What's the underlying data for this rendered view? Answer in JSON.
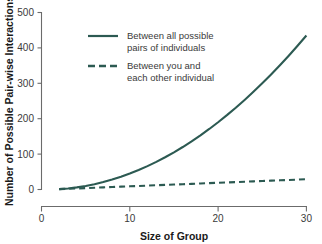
{
  "chart_data": {
    "type": "line",
    "title": "",
    "xlabel": "Size of Group",
    "ylabel": "Number of Possible Pair-wise Interactions",
    "xlim": [
      0,
      30
    ],
    "ylim": [
      0,
      500
    ],
    "xticks": [
      0,
      10,
      20,
      30
    ],
    "yticks": [
      0,
      100,
      200,
      300,
      400,
      500
    ],
    "xtick_labels": [
      "0",
      "10",
      "20",
      "30"
    ],
    "ytick_labels": [
      "0",
      "100",
      "200",
      "300",
      "400",
      "500"
    ],
    "grid": false,
    "legend_position": "upper-left-inside",
    "line_color": "#2c5a52",
    "x": [
      2,
      3,
      4,
      5,
      6,
      7,
      8,
      9,
      10,
      11,
      12,
      13,
      14,
      15,
      16,
      17,
      18,
      19,
      20,
      21,
      22,
      23,
      24,
      25,
      26,
      27,
      28,
      29,
      30
    ],
    "series": [
      {
        "name": "Between all possible pairs of individuals",
        "style": "solid",
        "values": [
          1,
          3,
          6,
          10,
          15,
          21,
          28,
          36,
          45,
          55,
          66,
          78,
          91,
          105,
          120,
          136,
          153,
          171,
          190,
          210,
          231,
          253,
          276,
          300,
          325,
          351,
          378,
          406,
          435
        ]
      },
      {
        "name": "Between you and each other individual",
        "style": "dashed",
        "values": [
          1,
          2,
          3,
          4,
          5,
          6,
          7,
          8,
          9,
          10,
          11,
          12,
          13,
          14,
          15,
          16,
          17,
          18,
          19,
          20,
          21,
          22,
          23,
          24,
          25,
          26,
          27,
          28,
          29
        ]
      }
    ]
  },
  "legend": {
    "entries": [
      {
        "line1": "Between all possible",
        "line2": "pairs of individuals",
        "style": "solid"
      },
      {
        "line1": "Between you and",
        "line2": "each other individual",
        "style": "dashed"
      }
    ]
  },
  "axes": {
    "x_title": "Size of Group",
    "y_title": "Number of Possible Pair-wise Interactions"
  }
}
